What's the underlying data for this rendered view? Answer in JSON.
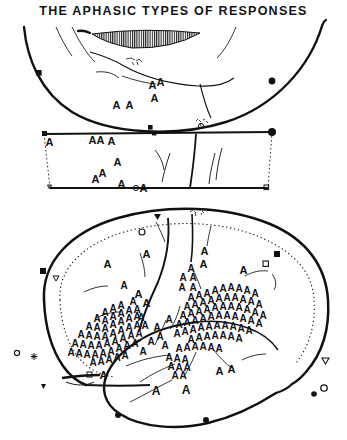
{
  "figure": {
    "title": "THE APHASIC TYPES OF RESPONSES",
    "medium": "ink line drawing",
    "background_color": "#ffffff",
    "ink_color": "#111111",
    "width": 347,
    "height": 440
  },
  "panels": [
    {
      "id": "superior-view",
      "name": "top-cortical-arc",
      "description": "upper arc-shaped cortical outline with hatched lens-shaped band and sulcal lines",
      "marker_symbols": [
        "filled-square",
        "filled-circle",
        "filled-square-small",
        "open-circle"
      ],
      "response_letter": "A",
      "response_count": 6
    },
    {
      "id": "middle-band",
      "name": "middle-trapezoid-band",
      "description": "trapezoid strip between the two brain views, bounded by dotted side edges",
      "marker_symbols": [
        "filled-square",
        "filled-circle",
        "open-triangle",
        "open-square",
        "open-circle"
      ],
      "response_letter": "A",
      "response_count": 10
    },
    {
      "id": "lateral-view",
      "name": "large-lateral-brain",
      "description": "large lateral hemisphere outline with inner dotted contour, central sulcus, sylvian fissure and temporal lobe",
      "marker_symbols": [
        "filled-square",
        "open-square",
        "open-triangle",
        "open-circle",
        "filled-triangle",
        "star",
        "filled-circle"
      ],
      "response_letter": "A",
      "response_count": 180
    }
  ],
  "legend_note": {
    "symbol": "A",
    "meaning": "aphasic response site"
  },
  "annotations": [
    {
      "name": "top-script-annotation",
      "text": "",
      "legible": false
    },
    {
      "name": "mid-script-annotation",
      "text": "",
      "legible": false
    },
    {
      "name": "lateral-top-script-annotation",
      "text": "",
      "legible": false
    }
  ],
  "colors": {
    "ink": "#111111",
    "paper": "#ffffff",
    "light_ink": "#555555"
  }
}
